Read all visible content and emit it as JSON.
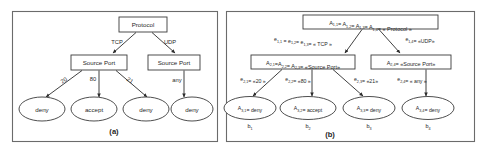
{
  "figure": {
    "panels": [
      {
        "id": "a",
        "caption": "(a)",
        "root": {
          "label": "Protocol"
        },
        "level2": [
          {
            "label": "Source Port"
          },
          {
            "label": "Source Port"
          }
        ],
        "root_edges": [
          {
            "label": "TCP"
          },
          {
            "label": "UDP"
          }
        ],
        "level2_edges": [
          {
            "label": "20"
          },
          {
            "label": "80"
          },
          {
            "label": "21"
          },
          {
            "label": "any"
          }
        ],
        "leaves": [
          {
            "label": "deny"
          },
          {
            "label": "accept"
          },
          {
            "label": "deny"
          },
          {
            "label": "deny"
          }
        ]
      },
      {
        "id": "b",
        "caption": "(b)",
        "root": {
          "prefix": "A",
          "terms": [
            "A1,1",
            "A1,2",
            "A1,3",
            "A1,4"
          ],
          "value": "« Protocol »",
          "full": "A1,1= A1,2= A1,3= A1,4= « Protocol »"
        },
        "root_edges": [
          {
            "full": "e1,1 = e1,2= e1,3= « TCP »"
          },
          {
            "full": "e1,4= «UDP»"
          }
        ],
        "level2": [
          {
            "full": "A2,1=A2,2= A2,3= «Source Port»"
          },
          {
            "full": "A2,4= «Source Port»"
          }
        ],
        "level2_edges": [
          {
            "full": "e2,1= «20 »"
          },
          {
            "full": "e2,2= «80 »"
          },
          {
            "full": "e2,3= «21»"
          },
          {
            "full": "e2,4= « any »"
          }
        ],
        "leaves": [
          {
            "full": "A3,1= deny",
            "branch": "b1"
          },
          {
            "full": "A3,2= accept",
            "branch": "b2"
          },
          {
            "full": "A3,3= deny",
            "branch": "b3"
          },
          {
            "full": "A3,4= deny",
            "branch": "b4"
          }
        ]
      }
    ],
    "colors": {
      "background": "#ffffff",
      "frame_stroke": "#6b6b6b",
      "node_stroke": "#3a3a3a",
      "edge_stroke": "#2b2b2b",
      "text": "#1f1f1f"
    }
  }
}
